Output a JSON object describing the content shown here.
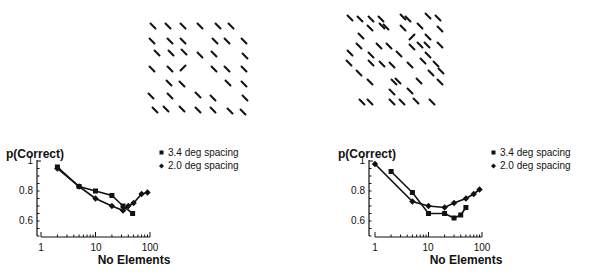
{
  "figure": {
    "background": "#ffffff",
    "ink": "#111111"
  },
  "panels": [
    {
      "id": "left",
      "stimulus": {
        "segment_length": 7,
        "elements": [
          [
            153,
            26,
            0
          ],
          [
            168,
            26,
            0
          ],
          [
            183,
            26,
            0
          ],
          [
            200,
            26,
            0
          ],
          [
            218,
            26,
            0
          ],
          [
            231,
            26,
            0
          ],
          [
            152,
            41,
            0
          ],
          [
            170,
            41,
            0
          ],
          [
            183,
            41,
            0
          ],
          [
            215,
            41,
            0
          ],
          [
            227,
            41,
            0
          ],
          [
            244,
            41,
            0
          ],
          [
            157,
            53,
            0
          ],
          [
            171,
            53,
            0
          ],
          [
            184,
            52,
            0
          ],
          [
            200,
            55,
            0
          ],
          [
            214,
            54,
            0
          ],
          [
            245,
            56,
            0
          ],
          [
            152,
            69,
            0
          ],
          [
            170,
            69,
            0
          ],
          [
            183,
            68,
            1
          ],
          [
            214,
            69,
            0
          ],
          [
            227,
            69,
            0
          ],
          [
            244,
            69,
            0
          ],
          [
            169,
            83,
            0
          ],
          [
            182,
            84,
            0
          ],
          [
            228,
            83,
            0
          ],
          [
            244,
            84,
            0
          ],
          [
            151,
            96,
            0
          ],
          [
            170,
            96,
            0
          ],
          [
            198,
            95,
            0
          ],
          [
            213,
            98,
            0
          ],
          [
            245,
            98,
            0
          ],
          [
            155,
            110,
            0
          ],
          [
            166,
            109,
            0
          ],
          [
            182,
            109,
            0
          ],
          [
            198,
            110,
            0
          ],
          [
            213,
            110,
            0
          ],
          [
            230,
            111,
            0
          ],
          [
            243,
            112,
            0
          ]
        ]
      },
      "chart": {
        "ylabel": "p(Correct)",
        "xlabel": "No Elements",
        "x_ticks": [
          "1",
          "10",
          "100"
        ],
        "y_ticks": [
          "1",
          "0.8",
          "0.6"
        ],
        "legend": [
          {
            "marker": "square",
            "label": "3.4 deg spacing"
          },
          {
            "marker": "diamond",
            "label": "2.0 deg spacing"
          }
        ]
      }
    },
    {
      "id": "right",
      "stimulus": {
        "segment_length": 7,
        "elements": [
          [
            350,
            18,
            0
          ],
          [
            360,
            19,
            0
          ],
          [
            371,
            19,
            0
          ],
          [
            381,
            19,
            0
          ],
          [
            403,
            17,
            0
          ],
          [
            408,
            19,
            0
          ],
          [
            428,
            16,
            0
          ],
          [
            438,
            18,
            0
          ],
          [
            370,
            28,
            0
          ],
          [
            382,
            26,
            0
          ],
          [
            386,
            27,
            0
          ],
          [
            403,
            28,
            0
          ],
          [
            420,
            26,
            0
          ],
          [
            440,
            29,
            0
          ],
          [
            361,
            36,
            0
          ],
          [
            412,
            37,
            1
          ],
          [
            428,
            37,
            0
          ],
          [
            359,
            46,
            0
          ],
          [
            379,
            46,
            0
          ],
          [
            389,
            46,
            0
          ],
          [
            412,
            47,
            0
          ],
          [
            420,
            45,
            0
          ],
          [
            427,
            45,
            0
          ],
          [
            440,
            45,
            0
          ],
          [
            350,
            53,
            0
          ],
          [
            371,
            55,
            0
          ],
          [
            399,
            54,
            0
          ],
          [
            428,
            55,
            0
          ],
          [
            349,
            63,
            0
          ],
          [
            371,
            63,
            0
          ],
          [
            382,
            64,
            0
          ],
          [
            392,
            65,
            0
          ],
          [
            410,
            65,
            0
          ],
          [
            423,
            61,
            0
          ],
          [
            436,
            64,
            0
          ],
          [
            359,
            73,
            0
          ],
          [
            431,
            73,
            0
          ],
          [
            441,
            71,
            0
          ],
          [
            370,
            82,
            0
          ],
          [
            394,
            82,
            0
          ],
          [
            398,
            81,
            0
          ],
          [
            419,
            81,
            0
          ],
          [
            440,
            82,
            0
          ],
          [
            392,
            92,
            0
          ],
          [
            410,
            91,
            0
          ],
          [
            362,
            102,
            0
          ],
          [
            370,
            102,
            0
          ],
          [
            392,
            102,
            0
          ],
          [
            402,
            102,
            0
          ],
          [
            416,
            101,
            0
          ],
          [
            432,
            102,
            0
          ]
        ]
      },
      "chart": {
        "ylabel": "p(Correct)",
        "xlabel": "No Elements",
        "x_ticks": [
          "1",
          "10",
          "100"
        ],
        "y_ticks": [
          "1",
          "0.8",
          "0.6"
        ],
        "legend": [
          {
            "marker": "square",
            "label": "3.4 deg spacing"
          },
          {
            "marker": "diamond",
            "label": "2.0 deg spacing"
          }
        ]
      }
    }
  ],
  "chart_data": [
    {
      "type": "line",
      "title": "",
      "xlabel": "No Elements",
      "ylabel": "p(Correct)",
      "xscale": "log",
      "xlim": [
        1,
        100
      ],
      "ylim": [
        0.5,
        1.0
      ],
      "x_ticks": [
        1,
        10,
        100
      ],
      "y_ticks": [
        0.6,
        0.8,
        1
      ],
      "grid": false,
      "legend_position": "upper right, outside plot",
      "series": [
        {
          "name": "3.4 deg spacing",
          "marker": "square",
          "x": [
            2,
            5,
            10,
            20,
            32,
            48
          ],
          "y": [
            0.96,
            0.83,
            0.8,
            0.77,
            0.7,
            0.65
          ]
        },
        {
          "name": "2.0 deg spacing",
          "marker": "diamond",
          "x": [
            2,
            5,
            10,
            20,
            32,
            40,
            50,
            70,
            90
          ],
          "y": [
            0.95,
            0.83,
            0.75,
            0.7,
            0.67,
            0.7,
            0.72,
            0.78,
            0.79
          ]
        }
      ]
    },
    {
      "type": "line",
      "title": "",
      "xlabel": "No Elements",
      "ylabel": "p(Correct)",
      "xscale": "log",
      "xlim": [
        1,
        100
      ],
      "ylim": [
        0.5,
        1.0
      ],
      "x_ticks": [
        1,
        10,
        100
      ],
      "y_ticks": [
        0.6,
        0.8,
        1
      ],
      "grid": false,
      "legend_position": "upper right, outside plot",
      "series": [
        {
          "name": "3.4 deg spacing",
          "marker": "square",
          "x": [
            2,
            5,
            10,
            20,
            30,
            40,
            50
          ],
          "y": [
            0.93,
            0.79,
            0.65,
            0.65,
            0.62,
            0.64,
            0.69
          ]
        },
        {
          "name": "2.0 deg spacing",
          "marker": "diamond",
          "x": [
            1,
            5,
            10,
            20,
            30,
            50,
            70,
            90
          ],
          "y": [
            0.98,
            0.73,
            0.7,
            0.69,
            0.72,
            0.75,
            0.78,
            0.81
          ]
        }
      ]
    }
  ]
}
